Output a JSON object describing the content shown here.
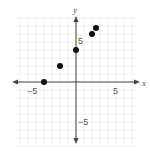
{
  "chart_data": {
    "type": "scatter",
    "title": "",
    "xlabel": "x",
    "ylabel": "y",
    "xlim": [
      -8,
      8
    ],
    "ylim": [
      -9,
      9
    ],
    "grid": true,
    "legend": null,
    "x_ticks_labeled": [
      -5,
      5
    ],
    "y_ticks_labeled": [
      5,
      -5
    ],
    "tick_labels": {
      "x_neg": "−5",
      "x_pos": "5",
      "y_pos": "5",
      "y_neg": "−5"
    },
    "points": [
      {
        "x": -4,
        "y": 0
      },
      {
        "x": -2,
        "y": 2
      },
      {
        "x": 0,
        "y": 4
      },
      {
        "x": 2,
        "y": 6
      },
      {
        "x": 2.5,
        "y": 6.75
      }
    ]
  },
  "colors": {
    "axis": "#444444",
    "grid": "#ececec",
    "point": "#111111",
    "label": "#555555"
  }
}
